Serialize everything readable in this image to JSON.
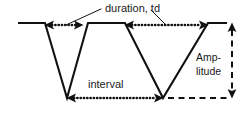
{
  "figure": {
    "background_color": "#ffffff",
    "stroke_color": "#111111",
    "text_color": "#1a1a1a",
    "width": 247,
    "height": 115
  },
  "labels": {
    "duration": "duration, td",
    "interval": "interval",
    "amplitude_line1": "Amp-",
    "amplitude_line2": "litude"
  },
  "chart_data": {
    "type": "line",
    "xlabel": "",
    "ylabel": "",
    "grid": false,
    "legend": "none",
    "annotations": [
      {
        "name": "duration-td",
        "text": "duration, td",
        "measure": "pulse duration",
        "symbol": "td",
        "spans": [
          {
            "from_x": 45,
            "to_x": 83,
            "y": 25
          },
          {
            "from_x": 125,
            "to_x": 208,
            "y": 25
          }
        ],
        "arrow_style": "dotted double-headed"
      },
      {
        "name": "interval",
        "text": "interval",
        "measure": "time between pulse minima",
        "spans": [
          {
            "from_x": 66,
            "to_x": 163,
            "y": 98
          }
        ],
        "arrow_style": "dotted double-headed"
      },
      {
        "name": "amplitude",
        "text": "Amp-litude",
        "measure": "peak-to-trough height",
        "spans": [
          {
            "x": 232,
            "from_y": 23,
            "to_y": 98
          }
        ],
        "arrow_style": "dashed double-headed vertical"
      }
    ],
    "waveform_points": [
      {
        "x": 18,
        "y": 23
      },
      {
        "x": 45,
        "y": 23
      },
      {
        "x": 67,
        "y": 98
      },
      {
        "x": 88,
        "y": 23
      },
      {
        "x": 125,
        "y": 23
      },
      {
        "x": 163,
        "y": 98
      },
      {
        "x": 208,
        "y": 23
      },
      {
        "x": 227,
        "y": 23
      }
    ],
    "baseline_top_y": 23,
    "baseline_bottom_y": 98
  }
}
